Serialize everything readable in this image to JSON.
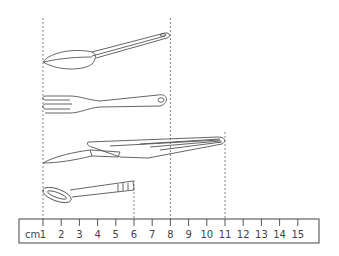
{
  "figure": {
    "stroke_color": "#555555",
    "guide_color": "#666666"
  },
  "ruler": {
    "unit_label": "cm",
    "tick_labels": [
      "1",
      "2",
      "3",
      "4",
      "5",
      "6",
      "7",
      "8",
      "9",
      "10",
      "11",
      "12",
      "13",
      "14",
      "15"
    ],
    "start_cm": 1,
    "end_cm": 15
  },
  "guides": [
    {
      "name": "guide-1cm",
      "cm": 1
    },
    {
      "name": "guide-6cm",
      "cm": 6
    },
    {
      "name": "guide-8cm",
      "cm": 8
    },
    {
      "name": "guide-11cm",
      "cm": 11
    }
  ],
  "objects": [
    {
      "name": "spoon",
      "start_cm": 1,
      "end_cm": 8
    },
    {
      "name": "fork",
      "start_cm": 1,
      "end_cm": 8
    },
    {
      "name": "spatula",
      "start_cm": 1,
      "end_cm": 11
    },
    {
      "name": "key",
      "start_cm": 1,
      "end_cm": 6
    }
  ]
}
